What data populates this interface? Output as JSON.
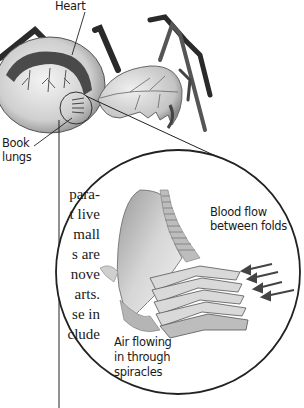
{
  "figure": {
    "labels": {
      "heart": "Heart",
      "book_lungs_line1": "Book",
      "book_lungs_line2": "lungs",
      "blood_flow_line1": "Blood flow",
      "blood_flow_line2": "between folds",
      "air_line1": "Air flowing",
      "air_line2": "in through",
      "air_line3": "spiracles"
    }
  },
  "body_text": {
    "lines": [
      "para-",
      "t live",
      "mall",
      "s are",
      "nove",
      "arts.",
      "se in",
      "clude"
    ]
  }
}
